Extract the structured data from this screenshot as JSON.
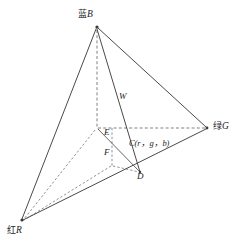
{
  "figure": {
    "background_color": "#ffffff",
    "line_color": "#4a4a4a",
    "dashed_line_color": "#6b6b6b",
    "text_color": "#1d1d1d",
    "width": 243,
    "height": 245
  },
  "labels": {
    "blue_vertex": {
      "cjk": "蓝",
      "latin": "B",
      "full": "蓝B"
    },
    "green_vertex": {
      "cjk": "绿",
      "latin": "G",
      "full": "绿G"
    },
    "red_vertex": {
      "cjk": "红",
      "latin": "R",
      "full": "红R"
    },
    "white_point": "W",
    "point_e": "E",
    "point_f": "F",
    "point_d": "D",
    "color_point": "C(r，g，b)"
  },
  "geometry": {
    "vertices": {
      "B": {
        "x": 97,
        "y": 27
      },
      "G": {
        "x": 207,
        "y": 128
      },
      "R": {
        "x": 22,
        "y": 220
      },
      "E": {
        "x": 97,
        "y": 128
      },
      "D": {
        "x": 140,
        "y": 172
      },
      "C": {
        "x": 130,
        "y": 160
      },
      "F": {
        "x": 113,
        "y": 162
      },
      "W": {
        "x": 120,
        "y": 112
      }
    },
    "solid_edges": [
      [
        "B",
        "G"
      ],
      [
        "B",
        "R"
      ],
      [
        "R",
        "G"
      ],
      [
        "B",
        "D"
      ],
      [
        "E",
        "D"
      ]
    ],
    "dashed_edges": [
      [
        "B",
        "E"
      ],
      [
        "E",
        "G"
      ],
      [
        "E",
        "R"
      ],
      [
        "E",
        "F"
      ],
      [
        "F",
        "R"
      ],
      [
        "F",
        "D"
      ]
    ]
  }
}
